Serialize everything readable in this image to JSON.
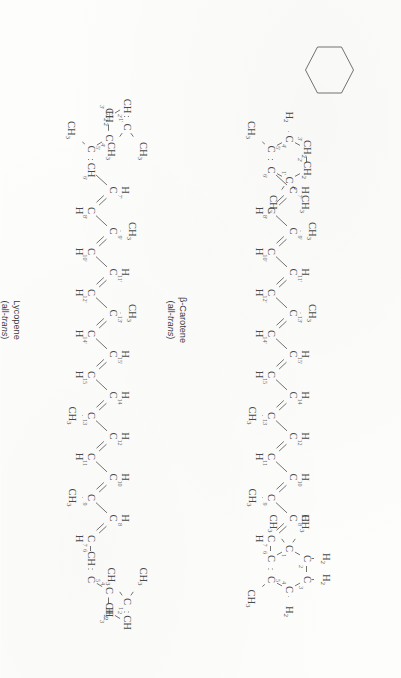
{
  "figure": {
    "background_color": "#fdfdfc",
    "ink_color": "#4a4a4a",
    "orientation": "rotated-90-ccw",
    "molecules": [
      {
        "id": "beta-carotene",
        "caption_line1": "β-Carotene",
        "caption_line2_prefix": "(all-",
        "caption_line2_italic": "trans",
        "caption_line2_suffix": ")",
        "atoms": {
          "C": "C",
          "H": "H",
          "CH3": "CH",
          "CH3_sub": "3",
          "CH2": "CH",
          "CH2_sub": "2",
          "H2": "H",
          "H2_sub": "2"
        },
        "ring_primed_numbers": [
          "1'",
          "2'",
          "3'",
          "4'",
          "5'",
          "6'"
        ],
        "chain_primed_numbers": [
          "7'",
          "8'",
          "9'",
          "10'",
          "11'",
          "12'",
          "13'",
          "14'",
          "15'"
        ],
        "chain_numbers": [
          "15",
          "14",
          "13",
          "12",
          "11",
          "10",
          "9",
          "8",
          "7"
        ],
        "ring_numbers": [
          "6",
          "5",
          "4",
          "3",
          "2",
          "1"
        ],
        "methyl_count": 8,
        "formula_note": "two β-ionone rings"
      },
      {
        "id": "lycopene",
        "caption_line1": "Lycopene",
        "caption_line2_prefix": "(all-",
        "caption_line2_italic": "trans",
        "caption_line2_suffix": ")",
        "atoms": {
          "C": "C",
          "H": "H",
          "CH3": "CH",
          "CH3_sub": "3",
          "CH2": "CH",
          "CH2_sub": "2",
          "CH": "CH",
          "H2": "H",
          "H2_sub": "2"
        },
        "ring_primed_numbers": [
          "1'",
          "2'",
          "3'",
          "4'",
          "5'",
          "6'"
        ],
        "chain_primed_numbers": [
          "7'",
          "8'",
          "9'",
          "10'",
          "11'",
          "12'",
          "13'",
          "14'",
          "15'"
        ],
        "chain_numbers": [
          "15",
          "14",
          "13",
          "12",
          "11",
          "10",
          "9",
          "8",
          "7"
        ],
        "ring_numbers": [
          "6",
          "5",
          "4",
          "3",
          "2",
          "1"
        ],
        "methyl_count": 8,
        "formula_note": "acyclic open-chain ends"
      }
    ]
  }
}
